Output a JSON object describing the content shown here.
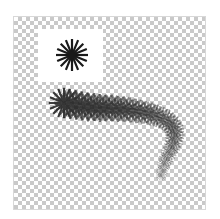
{
  "canvas": {
    "background": "transparent-checkerboard",
    "checker_colors": [
      "#ffffff",
      "#c9c9c9"
    ]
  },
  "brush_preview": {
    "icon": "starburst-brush-icon",
    "spokes": 16,
    "color": "#1a1a1a"
  },
  "stroke": {
    "icon": "brush-stroke",
    "color": "#1a1a1a"
  }
}
